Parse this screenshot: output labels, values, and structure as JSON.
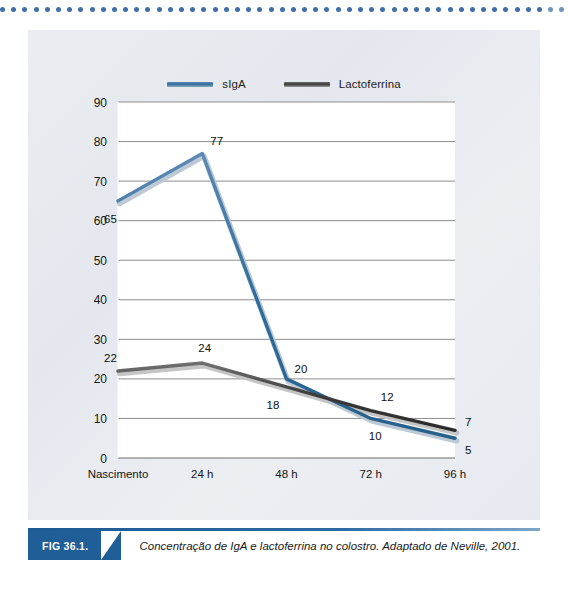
{
  "figure": {
    "tag": "FIG 36.1.",
    "caption": "Concentração de IgA e lactoferrina no colostro. Adaptado de Neville, 2001."
  },
  "legend": {
    "items": [
      {
        "label": "sIgA",
        "color": "#2f6f9e",
        "key": "siga"
      },
      {
        "label": "Lactoferrina",
        "color": "#3a3a3a",
        "key": "lacto"
      }
    ]
  },
  "chart_data": {
    "type": "line",
    "title": "",
    "xlabel": "",
    "ylabel": "",
    "categories": [
      "Nascimento",
      "24 h",
      "48 h",
      "72 h",
      "96 h"
    ],
    "ylim": [
      0,
      90
    ],
    "yticks": [
      0,
      10,
      20,
      30,
      40,
      50,
      60,
      70,
      80,
      90
    ],
    "grid": true,
    "legend_position": "top-center",
    "series": [
      {
        "name": "sIgA",
        "color": "#2f6f9e",
        "values": [
          65,
          77,
          20,
          10,
          5
        ],
        "labels": [
          "65",
          "77",
          "20",
          "10",
          "5"
        ]
      },
      {
        "name": "Lactoferrina",
        "color": "#3a3a3a",
        "values": [
          22,
          24,
          18,
          12,
          7
        ],
        "labels": [
          "22",
          "24",
          "18",
          "12",
          "7"
        ]
      }
    ]
  }
}
